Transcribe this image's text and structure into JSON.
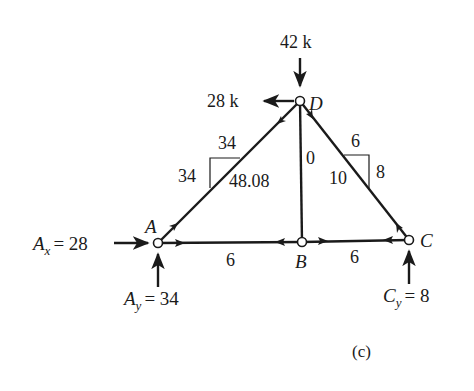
{
  "figure": {
    "caption": "(c)",
    "nodes": {
      "A": {
        "label": "A",
        "x": 158,
        "y": 243
      },
      "B": {
        "label": "B",
        "x": 302,
        "y": 242
      },
      "C": {
        "label": "C",
        "x": 409,
        "y": 240
      },
      "D": {
        "label": "D",
        "x": 300,
        "y": 101
      }
    },
    "members": [
      {
        "id": "AD",
        "force": "48.08",
        "slope_rise": "34",
        "slope_run": "34"
      },
      {
        "id": "DB",
        "force": "0"
      },
      {
        "id": "DC",
        "force": "10",
        "slope_rise": "8",
        "slope_run": "6"
      },
      {
        "id": "AB",
        "force": "6"
      },
      {
        "id": "BC",
        "force": "6"
      }
    ],
    "loads": {
      "D_vertical": "42 k",
      "D_horizontal": "28 k"
    },
    "reactions": {
      "Ax": {
        "symbol": "A",
        "sub": "x",
        "value": "= 28"
      },
      "Ay": {
        "symbol": "A",
        "sub": "y",
        "value": "= 34"
      },
      "Cy": {
        "symbol": "C",
        "sub": "y",
        "value": "= 8"
      }
    }
  }
}
